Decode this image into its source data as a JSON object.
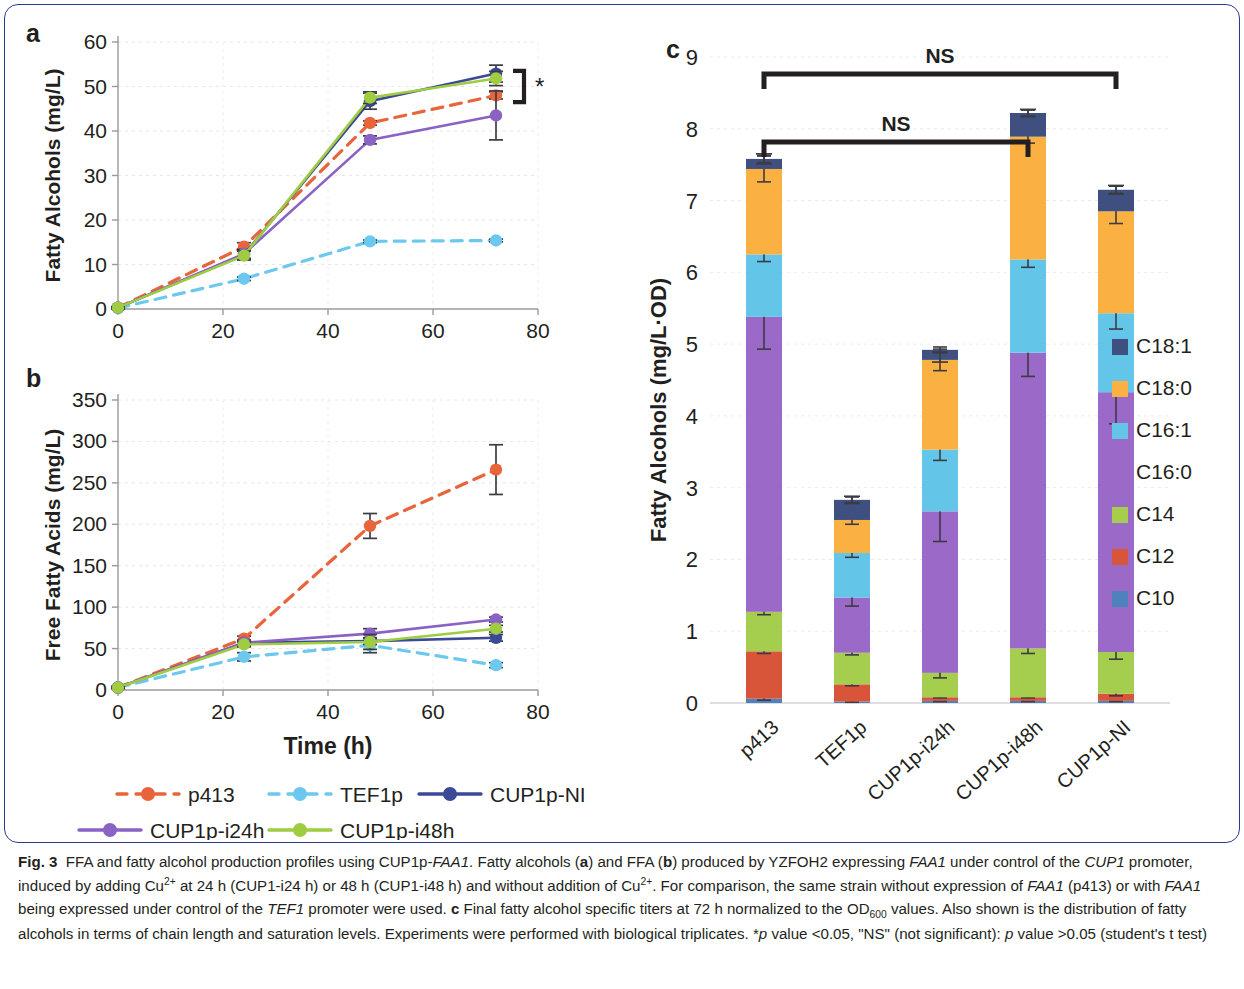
{
  "figure": {
    "label": "Fig. 3",
    "panels": {
      "a": "a",
      "b": "b",
      "c": "c"
    }
  },
  "caption": {
    "bold_label": "Fig. 3",
    "text": "FFA and fatty alcohol production profiles using CUP1p-FAA1. Fatty alcohols (a) and FFA (b) produced by YZFOH2 expressing FAA1 under control of the CUP1 promoter, induced by adding Cu2+ at 24 h (CUP1-i24 h) or 48 h (CUP1-i48 h) and without addition of Cu2+. For comparison, the same strain without expression of FAA1 (p413) or with FAA1 being expressed under control of the TEF1 promoter were used. c Final fatty alcohol specific titers at 72 h normalized to the OD600 values. Also shown is the distribution of fatty alcohols in terms of chain length and saturation levels. Experiments were performed with biological triplicates. *p value <0.05, \"NS\" (not significant): p value >0.05 (student's t test)"
  },
  "series_legend": {
    "items": [
      {
        "label": "p413",
        "color": "#e8653c",
        "dashed": true
      },
      {
        "label": "TEF1p",
        "color": "#6cc8ef",
        "dashed": true
      },
      {
        "label": "CUP1p-NI",
        "color": "#3b4a96",
        "dashed": false
      },
      {
        "label": "CUP1p-i24h",
        "color": "#8a62c4",
        "dashed": false
      },
      {
        "label": "CUP1p-i48h",
        "color": "#a0cc42",
        "dashed": false
      }
    ]
  },
  "chart_data": [
    {
      "id": "panel_a",
      "type": "line",
      "title": "",
      "xlabel": "",
      "ylabel": "Fatty Alcohols (mg/L)",
      "x": [
        0,
        24,
        48,
        72
      ],
      "xlim": [
        0,
        80
      ],
      "ylim": [
        0,
        60
      ],
      "xticks": [
        0,
        20,
        40,
        60,
        80
      ],
      "yticks": [
        0,
        10,
        20,
        30,
        40,
        50,
        60
      ],
      "grid": true,
      "legend_position": "below",
      "annotation": {
        "symbol": "*",
        "bracket": "significance bracket at 72 h"
      },
      "series": [
        {
          "name": "p413",
          "color": "#e8653c",
          "dashed": true,
          "values": [
            0.3,
            14.0,
            41.8,
            48.0
          ],
          "errors": [
            0.2,
            0.9,
            0.5,
            0.8
          ]
        },
        {
          "name": "TEF1p",
          "color": "#6cc8ef",
          "dashed": true,
          "values": [
            0.2,
            6.8,
            15.2,
            15.4
          ],
          "errors": [
            0.1,
            0.4,
            0.3,
            0.3
          ]
        },
        {
          "name": "CUP1p-NI",
          "color": "#3b4a96",
          "dashed": false,
          "values": [
            0.3,
            12.2,
            46.7,
            52.9
          ],
          "errors": [
            0.2,
            1.0,
            1.8,
            1.9
          ]
        },
        {
          "name": "CUP1p-i24h",
          "color": "#8a62c4",
          "dashed": false,
          "values": [
            0.3,
            12.4,
            38.0,
            43.5
          ],
          "errors": [
            0.2,
            1.0,
            0.9,
            5.5
          ]
        },
        {
          "name": "CUP1p-i48h",
          "color": "#a0cc42",
          "dashed": false,
          "values": [
            0.3,
            12.0,
            47.5,
            51.8
          ],
          "errors": [
            0.2,
            1.0,
            1.3,
            1.6
          ]
        }
      ]
    },
    {
      "id": "panel_b",
      "type": "line",
      "title": "",
      "xlabel": "Time (h)",
      "ylabel": "Free Fatty Acids (mg/L)",
      "x": [
        0,
        24,
        48,
        72
      ],
      "xlim": [
        0,
        80
      ],
      "ylim": [
        0,
        350
      ],
      "xticks": [
        0,
        20,
        40,
        60,
        80
      ],
      "yticks": [
        0,
        50,
        100,
        150,
        200,
        250,
        300,
        350
      ],
      "grid": true,
      "legend_position": "below",
      "series": [
        {
          "name": "p413",
          "color": "#e8653c",
          "dashed": true,
          "values": [
            3,
            62,
            198,
            266
          ],
          "errors": [
            1,
            3,
            15,
            30
          ]
        },
        {
          "name": "TEF1p",
          "color": "#6cc8ef",
          "dashed": true,
          "values": [
            3,
            40,
            54,
            30
          ],
          "errors": [
            1,
            5,
            9,
            3
          ]
        },
        {
          "name": "CUP1p-NI",
          "color": "#3b4a96",
          "dashed": false,
          "values": [
            3,
            57,
            59,
            63
          ],
          "errors": [
            1,
            3,
            4,
            4
          ]
        },
        {
          "name": "CUP1p-i24h",
          "color": "#8a62c4",
          "dashed": false,
          "values": [
            3,
            57,
            68,
            85
          ],
          "errors": [
            1,
            3,
            6,
            3
          ]
        },
        {
          "name": "CUP1p-i48h",
          "color": "#a0cc42",
          "dashed": false,
          "values": [
            3,
            55,
            58,
            74
          ],
          "errors": [
            1,
            3,
            9,
            4
          ]
        }
      ]
    },
    {
      "id": "panel_c",
      "type": "bar",
      "stacked": true,
      "title": "",
      "xlabel": "",
      "ylabel": "Fatty Alcohols (mg/L·OD)",
      "categories": [
        "p413",
        "TEF1p",
        "CUP1p-i24h",
        "CUP1p-i48h",
        "CUP1p-NI"
      ],
      "ylim": [
        0,
        9
      ],
      "yticks": [
        0,
        1,
        2,
        3,
        4,
        5,
        6,
        7,
        8,
        9
      ],
      "grid": true,
      "legend_position": "right",
      "legend_order": [
        "C18:1",
        "C18:0",
        "C16:1",
        "C16:0",
        "C14",
        "C12",
        "C10"
      ],
      "series": [
        {
          "name": "C10",
          "color": "#4f81bd",
          "values": [
            0.06,
            0.02,
            0.03,
            0.03,
            0.03
          ],
          "errors": [
            0.02,
            0.01,
            0.01,
            0.01,
            0.01
          ]
        },
        {
          "name": "C12",
          "color": "#d8553a",
          "values": [
            0.66,
            0.24,
            0.05,
            0.05,
            0.1
          ],
          "errors": [
            0.03,
            0.02,
            0.01,
            0.01,
            0.03
          ]
        },
        {
          "name": "C14",
          "color": "#a5ce4e",
          "values": [
            0.55,
            0.44,
            0.34,
            0.68,
            0.58
          ],
          "errors": [
            0.04,
            0.03,
            0.07,
            0.07,
            0.1
          ]
        },
        {
          "name": "C16:0",
          "color": "#9b69c7",
          "values": [
            4.11,
            0.77,
            2.25,
            4.12,
            3.62
          ],
          "errors": [
            0.45,
            0.12,
            0.42,
            0.33,
            0.44
          ]
        },
        {
          "name": "C16:1",
          "color": "#63c6e8",
          "values": [
            0.87,
            0.62,
            0.86,
            1.3,
            1.1
          ],
          "errors": [
            0.1,
            0.06,
            0.15,
            0.11,
            0.22
          ]
        },
        {
          "name": "C18:0",
          "color": "#fbb042",
          "values": [
            1.19,
            0.46,
            1.25,
            1.71,
            1.42
          ],
          "errors": [
            0.18,
            0.06,
            0.15,
            0.09,
            0.17
          ]
        },
        {
          "name": "C18:1",
          "color": "#3f5080",
          "values": [
            0.14,
            0.28,
            0.14,
            0.33,
            0.3
          ],
          "errors": [
            0.05,
            0.04,
            0.04,
            0.04,
            0.05
          ]
        }
      ],
      "totals": [
        7.58,
        2.83,
        4.82,
        8.22,
        7.15
      ],
      "total_errors": [
        0.07,
        0.05,
        0.07,
        0.05,
        0.06
      ],
      "annotations": [
        {
          "text": "NS",
          "from": "p413",
          "to": "CUP1p-NI",
          "level": 1
        },
        {
          "text": "NS",
          "from": "p413",
          "to": "CUP1p-i48h",
          "level": 2
        }
      ]
    }
  ]
}
